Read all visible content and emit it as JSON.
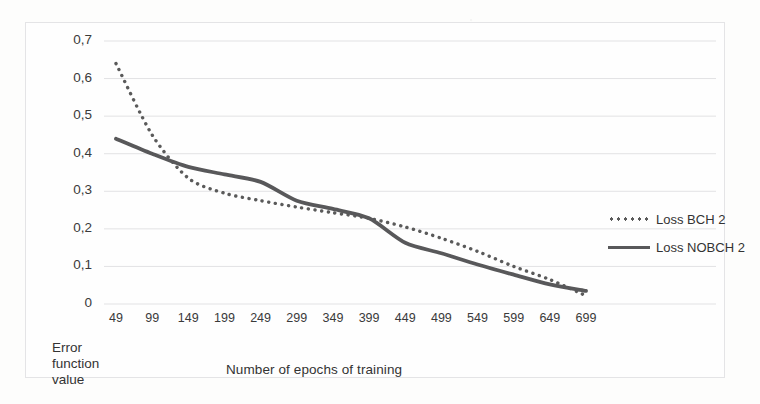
{
  "chart_data": {
    "type": "line",
    "title": "",
    "xlabel": "Number of epochs of training",
    "ylabel": "Error function value",
    "categories": [
      49,
      99,
      149,
      199,
      249,
      299,
      349,
      399,
      449,
      499,
      549,
      599,
      649,
      699
    ],
    "xtick_labels": [
      "49",
      "99",
      "149",
      "199",
      "249",
      "299",
      "349",
      "399",
      "449",
      "499",
      "549",
      "599",
      "649",
      "699"
    ],
    "ytick_labels": [
      "0,7",
      "0,6",
      "0,5",
      "0,4",
      "0,3",
      "0,2",
      "0,1",
      "0"
    ],
    "ytick_values": [
      0.7,
      0.6,
      0.5,
      0.4,
      0.3,
      0.2,
      0.1,
      0
    ],
    "ylim": [
      0,
      0.7
    ],
    "xlim": [
      49,
      699
    ],
    "grid": true,
    "grid_axis": "y",
    "legend_position": "right",
    "series": [
      {
        "name": "Loss BCH 2",
        "style": "dotted",
        "color": "#5a5a5a",
        "values": [
          0.64,
          0.45,
          0.335,
          0.295,
          0.275,
          0.258,
          0.243,
          0.228,
          0.205,
          0.175,
          0.14,
          0.1,
          0.065,
          0.022
        ]
      },
      {
        "name": "Loss NOBCH 2",
        "style": "solid",
        "color": "#58585a",
        "values": [
          0.44,
          0.4,
          0.365,
          0.345,
          0.325,
          0.275,
          0.253,
          0.228,
          0.163,
          0.135,
          0.105,
          0.078,
          0.052,
          0.035
        ]
      }
    ]
  },
  "axis": {
    "ylabel_lines": [
      "Error",
      "function",
      "value"
    ],
    "xlabel": "Number of epochs of training"
  },
  "legend": {
    "items": [
      {
        "label": "Loss BCH 2",
        "style": "dotted"
      },
      {
        "label": "Loss NOBCH 2",
        "style": "solid"
      }
    ]
  },
  "colors": {
    "series_dotted": "#5a5a5a",
    "series_solid": "#58585a",
    "gridline": "#e2e2e4",
    "frame": "#e4e4e6",
    "text": "#3a3a3a",
    "background": "#fdfdfc"
  }
}
